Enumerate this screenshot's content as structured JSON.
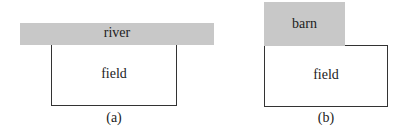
{
  "figures": [
    {
      "id": "a",
      "caption": "(a)",
      "top_region": {
        "label": "river",
        "color": "#c8c8c8"
      },
      "main_region": {
        "label": "field"
      }
    },
    {
      "id": "b",
      "caption": "(b)",
      "top_region": {
        "label": "barn",
        "color": "#c8c8c8"
      },
      "main_region": {
        "label": "field"
      }
    }
  ]
}
